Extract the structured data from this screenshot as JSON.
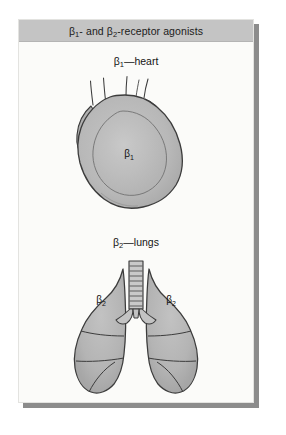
{
  "figure": {
    "header": {
      "title_html": "&#946;<sub>1</sub>- and &#946;<sub>2</sub>-receptor agonists",
      "title_plain": "β1- and β2-receptor agonists",
      "background_color": "#c4c4c4",
      "text_color": "#1b1b1b"
    },
    "panel": {
      "background_color": "#fbfbf9",
      "border_color": "#e3e3e0",
      "shadow_color": "#8c8c8c"
    },
    "sections": [
      {
        "id": "heart",
        "caption_html": "&#946;<sub>1</sub>&#8212;heart",
        "caption_plain": "β1—heart",
        "organ": "heart",
        "receptor_label_html": "&#946;<sub>1</sub>",
        "receptor_label_plain": "β1",
        "fill_color": "#b3b3b3",
        "inner_fill_color": "#bdbdbd",
        "outline_color": "#3c3c3c",
        "vessel_count": 4
      },
      {
        "id": "lungs",
        "caption_html": "&#946;<sub>2</sub>&#8212;lungs",
        "caption_plain": "β2—lungs",
        "organ": "lungs",
        "receptor_label_left_html": "&#946;<sub>2</sub>",
        "receptor_label_right_html": "&#946;<sub>2</sub>",
        "receptor_label_plain": "β2",
        "fill_color": "#b6b6b6",
        "trachea_fill_color": "#c9c9c9",
        "outline_color": "#3c3c3c",
        "lobe_count_left": 3,
        "lobe_count_right": 3
      }
    ]
  }
}
